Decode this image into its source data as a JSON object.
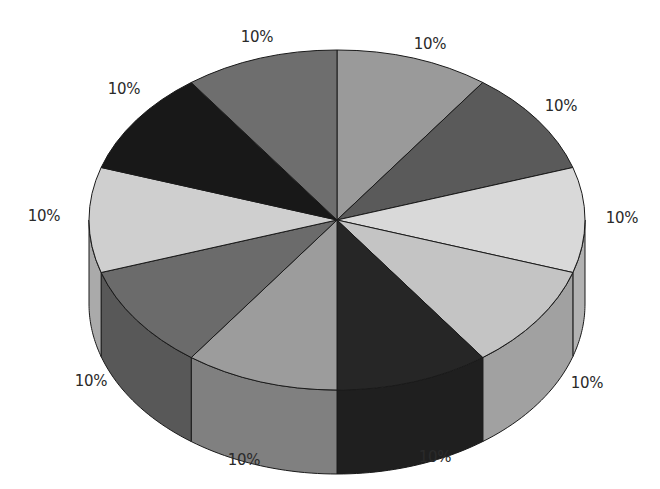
{
  "chart_data": {
    "type": "pie",
    "style": "3d",
    "title": "",
    "categories": [
      "Slice 1",
      "Slice 2",
      "Slice 3",
      "Slice 4",
      "Slice 5",
      "Slice 6",
      "Slice 7",
      "Slice 8",
      "Slice 9",
      "Slice 10"
    ],
    "values": [
      10,
      10,
      10,
      10,
      10,
      10,
      10,
      10,
      10,
      10
    ],
    "labels": [
      "10%",
      "10%",
      "10%",
      "10%",
      "10%",
      "10%",
      "10%",
      "10%",
      "10%",
      "10%"
    ],
    "legend": "none",
    "colors": [
      "#9a9a9a",
      "#5a5a5a",
      "#d9d9d9",
      "#c4c4c4",
      "#262626",
      "#9c9c9c",
      "#6b6b6b",
      "#cfcfcf",
      "#181818",
      "#6e6e6e"
    ],
    "label_positions": [
      {
        "x": 430,
        "y": 44
      },
      {
        "x": 561,
        "y": 106
      },
      {
        "x": 622,
        "y": 218
      },
      {
        "x": 587,
        "y": 383
      },
      {
        "x": 435,
        "y": 457
      },
      {
        "x": 244,
        "y": 460
      },
      {
        "x": 91,
        "y": 381
      },
      {
        "x": 44,
        "y": 216
      },
      {
        "x": 124,
        "y": 89
      },
      {
        "x": 257,
        "y": 37
      }
    ]
  }
}
